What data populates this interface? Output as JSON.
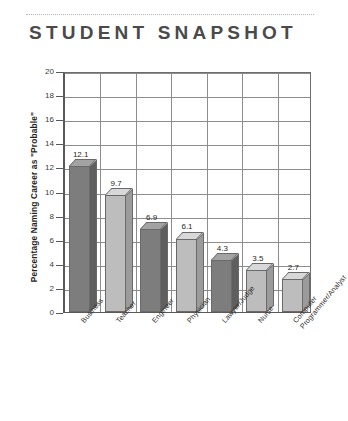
{
  "header": {
    "title": "STUDENT SNAPSHOT"
  },
  "chart_data": {
    "type": "bar",
    "title": "STUDENT SNAPSHOT",
    "xlabel": "",
    "ylabel": "Percentage Naming Career as \"Probable\"",
    "ylim": [
      0,
      20
    ],
    "ytick_labels": [
      "20",
      "18",
      "16",
      "14",
      "12",
      "10",
      "8",
      "6",
      "4",
      "2",
      "0"
    ],
    "ytick_values": [
      20,
      18,
      16,
      14,
      12,
      10,
      8,
      6,
      4,
      2,
      0
    ],
    "grid": true,
    "legend": "none",
    "categories": [
      "Business",
      "Teacher",
      "Engineer",
      "Physician",
      "Lawyer/Judge",
      "Nurse",
      "Computer\nProgrammer/Analyst"
    ],
    "values": [
      12.1,
      9.7,
      6.9,
      6.1,
      4.3,
      3.5,
      2.7
    ],
    "value_labels": [
      "12.1",
      "9.7",
      "6.9",
      "6.1",
      "4.3",
      "3.5",
      "2.7"
    ],
    "bar_shades": [
      "dark",
      "light",
      "dark",
      "light",
      "dark",
      "light",
      "light"
    ],
    "colors": {
      "bar_dark_front": "#7d7d7d",
      "bar_dark_top": "#a3a3a3",
      "bar_dark_side": "#5f5f5f",
      "bar_light_front": "#bdbdbd",
      "bar_light_top": "#d8d8d8",
      "bar_light_side": "#9b9b9b",
      "grid": "#8d8d8d",
      "axis": "#5a5a5a",
      "title": "#4a4a4a",
      "text": "#1f1f1f"
    }
  }
}
